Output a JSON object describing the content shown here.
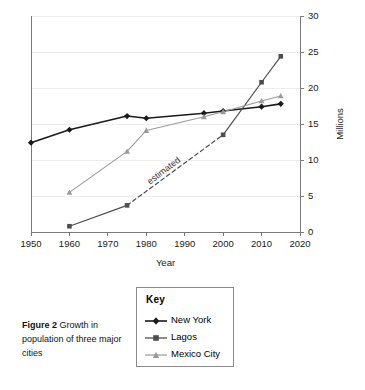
{
  "figure": {
    "caption_bold": "Figure 2",
    "caption_rest": " Growth in population of three major cities"
  },
  "legend": {
    "title": "Key",
    "entries": [
      {
        "label": "New York",
        "marker": "diamond",
        "color": "#1a1a1a"
      },
      {
        "label": "Lagos",
        "marker": "square",
        "color": "#4d4d4d"
      },
      {
        "label": "Mexico City",
        "marker": "triangle",
        "color": "#9a9a9a"
      }
    ]
  },
  "annotations": [
    {
      "text": "estimated",
      "x": 1985,
      "y": 8.2,
      "rotation": -37
    }
  ],
  "chart_data": {
    "type": "line",
    "title": "",
    "xlabel": "Year",
    "ylabel": "Millions",
    "xlim": [
      1950,
      2020
    ],
    "ylim": [
      0,
      30
    ],
    "xticks": [
      1950,
      1960,
      1970,
      1980,
      1990,
      2000,
      2010,
      2020
    ],
    "yticks": [
      0,
      5,
      10,
      15,
      20,
      25,
      30
    ],
    "grid": "horizontal",
    "y_axis_position": "right",
    "legend_position": "below-left",
    "series": [
      {
        "name": "New York",
        "marker": "diamond",
        "color": "#1a1a1a",
        "width": 1.6,
        "x": [
          1950,
          1960,
          1975,
          1980,
          1995,
          2000,
          2010,
          2015
        ],
        "values": [
          12.4,
          14.2,
          16.1,
          15.8,
          16.5,
          16.8,
          17.4,
          17.8
        ]
      },
      {
        "name": "Lagos",
        "marker": "square",
        "color": "#4d4d4d",
        "width": 1.2,
        "x": [
          1960,
          1975,
          2000,
          2010,
          2015
        ],
        "values": [
          0.8,
          3.7,
          13.5,
          20.8,
          24.4
        ],
        "dashed_segment": {
          "from_index": 1,
          "to_index": 2,
          "label": "estimated"
        }
      },
      {
        "name": "Mexico City",
        "marker": "triangle",
        "color": "#9a9a9a",
        "width": 1.1,
        "x": [
          1960,
          1975,
          1980,
          1995,
          2000,
          2010,
          2015
        ],
        "values": [
          5.5,
          11.2,
          14.1,
          16.0,
          16.7,
          18.2,
          18.9
        ]
      }
    ]
  }
}
